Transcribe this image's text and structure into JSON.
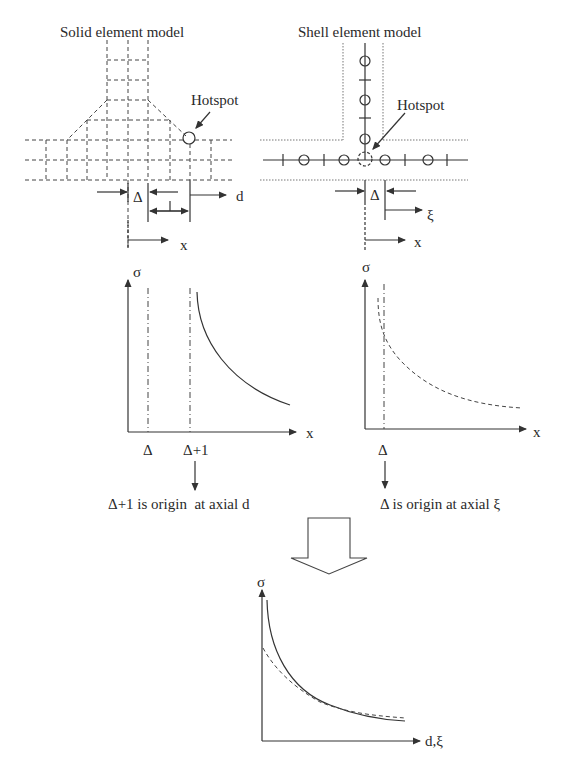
{
  "solid_model": {
    "title": "Solid element model",
    "hotspot_label": "Hotspot",
    "delta_label": "Δ",
    "length_label": "1",
    "d_axis_label": "d",
    "x_axis_label": "x"
  },
  "shell_model": {
    "title": "Shell element model",
    "hotspot_label": "Hotspot",
    "delta_label": "Δ",
    "xi_axis_label": "ξ",
    "x_axis_label": "x"
  },
  "solid_chart": {
    "y_label": "σ",
    "x_label": "x",
    "tick_delta": "Δ",
    "tick_delta_plus_1": "Δ+1",
    "caption": "Δ+1 is origin  at axial d",
    "curve_style": "solid"
  },
  "shell_chart": {
    "y_label": "σ",
    "x_label": "x",
    "tick_delta": "Δ",
    "caption": "Δ is origin at axial ξ",
    "curve_style": "dashed"
  },
  "combined_chart": {
    "y_label": "σ",
    "x_label": "d,ξ",
    "curves": [
      "solid (solid element)",
      "dashed (shell element)"
    ]
  },
  "transition_arrow": "down-block-arrow",
  "colors": {
    "line": "#333333",
    "background": "#ffffff"
  }
}
